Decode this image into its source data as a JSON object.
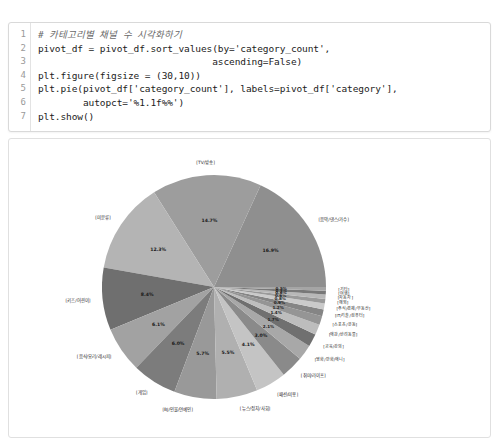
{
  "notebook": {
    "code_cell": {
      "line_numbers": [
        "1",
        "2",
        "3",
        "4",
        "5",
        "6",
        "7"
      ],
      "lines": [
        "# 카테고리별 채널 수 시각화하기",
        "pivot_df = pivot_df.sort_values(by='category_count',",
        "                               ascending=False)",
        "plt.figure(figsize = (30,10))",
        "plt.pie(pivot_df['category_count'], labels=pivot_df['category'],",
        "        autopct='%1.1f%%')",
        "plt.show()"
      ]
    }
  },
  "chart_data": {
    "type": "pie",
    "title": "",
    "autopct": "%1.1f%%",
    "legend": "none",
    "startangle": 0,
    "categories": [
      "[음악/댄스/가수]",
      "[TV/방송]",
      "[미분류]",
      "[키즈/어린이]",
      "[음식/요리/레시피]",
      "[게임]",
      "[BJ/인물/연예인]",
      "[뉴스/정치/사회]",
      "[패션/미용]",
      "[취미/라이프]",
      "[영화/만화/애니]",
      "[교육/강의]",
      "[애완/반려동물]",
      "[스포츠/운동]",
      "[IT/기술/컴퓨터]",
      "[주식/경제/부동산]",
      "[해외]",
      "[자동차]",
      "[여행]",
      "[기타]"
    ],
    "values": [
      16.9,
      14.7,
      12.3,
      8.4,
      6.1,
      6.0,
      5.7,
      5.5,
      4.1,
      3.0,
      2.1,
      1.7,
      1.4,
      1.2,
      0.9,
      0.8,
      0.6,
      0.6,
      0.5,
      0.5
    ],
    "labels_pct": [
      "16.9%",
      "14.7%",
      "12.3%",
      "8.4%",
      "6.1%",
      "6.0%",
      "5.7%",
      "5.5%",
      "4.1%",
      "3.0%",
      "2.1%",
      "1.7%",
      "1.4%",
      "1.2%",
      "0.9%",
      "0.8%",
      "0.6%",
      "0.6%",
      "0.5%",
      "0.5%"
    ],
    "colors": [
      "#8f8f8f",
      "#9d9d9d",
      "#b4b4b4",
      "#6f6f6f",
      "#a2a2a2",
      "#7c7c7c",
      "#999999",
      "#b0b0b0",
      "#c4c4c4",
      "#8a8a8a",
      "#a8a8a8",
      "#707070",
      "#bdbdbd",
      "#959595",
      "#858585",
      "#cacaca",
      "#9a9a9a",
      "#b8b8b8",
      "#787878",
      "#a5a5a5"
    ],
    "xlabel": "",
    "ylabel": ""
  }
}
